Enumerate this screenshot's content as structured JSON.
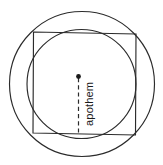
{
  "figure": {
    "background_color": "#ffffff",
    "stroke_color": "#2b2b2b",
    "label_color": "#1a1a1a",
    "labels": {
      "apothem": "apothem"
    },
    "shapes": {
      "circumscribed_circle": {
        "name": "circumscribed-circle",
        "cx": 82,
        "cy": 84,
        "r": 72.5
      },
      "inscribed_circle": {
        "name": "inscribed-circle",
        "cx": 81.5,
        "cy": 84,
        "r": 54.5
      },
      "square": {
        "name": "square",
        "points": "33.5,32 136,34 135.5,135 33,133"
      },
      "apothem_line": {
        "name": "apothem-line",
        "x1": 78.5,
        "y1": 78,
        "x2": 78.5,
        "y2": 133.5
      },
      "center_point": {
        "name": "center-point",
        "cx": 78.5,
        "cy": 76.5,
        "r": 2.4
      }
    },
    "label_position": {
      "x": 93,
      "y": 126,
      "rotation": -90
    }
  }
}
